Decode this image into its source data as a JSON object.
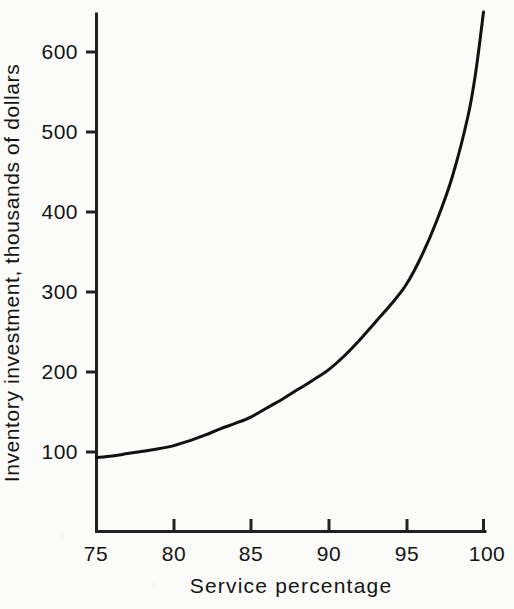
{
  "chart_data": {
    "type": "line",
    "title": "",
    "subtitle": "",
    "xlabel": "Service percentage",
    "ylabel": "Inventory investment, thousands of dollars",
    "xlim": [
      75,
      100
    ],
    "ylim": [
      0,
      660
    ],
    "xticks": [
      75,
      80,
      85,
      90,
      95,
      100
    ],
    "xtick_labels": [
      "75",
      "80",
      "85",
      "90",
      "95",
      "100"
    ],
    "yticks": [
      100,
      200,
      300,
      400,
      500,
      600
    ],
    "ytick_labels": [
      "100",
      "200",
      "300",
      "400",
      "500",
      "600"
    ],
    "grid": false,
    "legend": "none",
    "annotations": [],
    "series": [
      {
        "name": "Inventory investment",
        "color": "#111111",
        "line_width": 3,
        "x": [
          75,
          76,
          77,
          78,
          79,
          80,
          81,
          82,
          83,
          84,
          85,
          86,
          87,
          88,
          89,
          90,
          91,
          92,
          93,
          94,
          95,
          96,
          97,
          98,
          99,
          99.5,
          100
        ],
        "values": [
          93,
          95,
          98,
          101,
          104,
          108,
          114,
          121,
          129,
          136,
          144,
          155,
          166,
          178,
          190,
          203,
          220,
          240,
          262,
          284,
          309,
          345,
          390,
          445,
          520,
          575,
          650
        ]
      }
    ]
  },
  "axes": {
    "y_axis_name": "y-axis-line",
    "x_axis_name": "x-axis-line",
    "tick_direction": "outward"
  },
  "colors": {
    "curve": "#111111",
    "axis": "#222222",
    "background": "#fbfbf9",
    "text": "#141414"
  }
}
